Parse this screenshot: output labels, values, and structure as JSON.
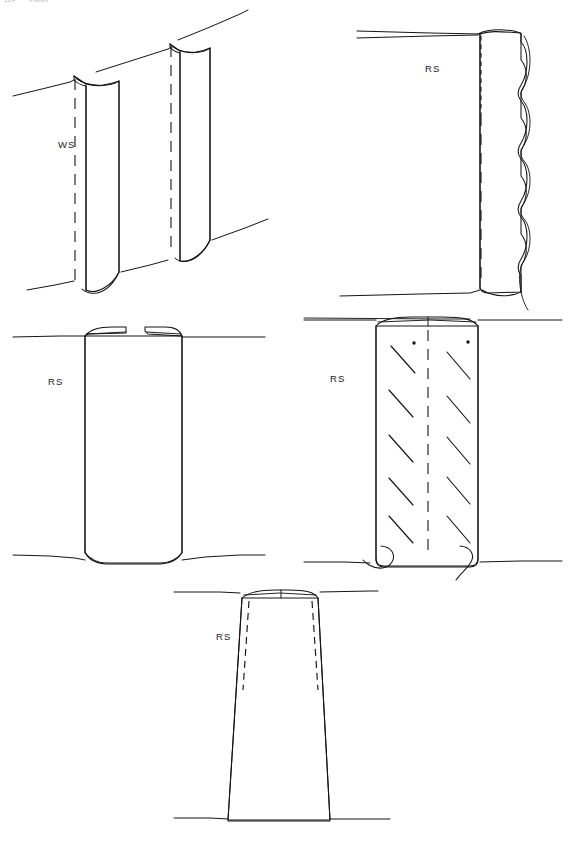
{
  "page": {
    "header_page_number": "124",
    "header_running_title": "Plates",
    "background_color": "#ffffff",
    "ink_color": "#141414",
    "width": 575,
    "height": 850
  },
  "figure": {
    "type": "technical-line-drawing-plate",
    "panel_count": 5,
    "panels": [
      {
        "id": "panel-1",
        "position": "top-left",
        "label": "WS",
        "label_x": 58,
        "label_y": 148,
        "description": "two overlapping vertical sheath blades rising from an inclined ground line, each with a curled top lip and a dashed hidden centre line",
        "ground_line": "inclined",
        "hidden_centerlines": 2,
        "has_top_lip": true,
        "has_hatching": false,
        "has_scalloped_edge": false,
        "has_dots": false,
        "shape": "double-blade"
      },
      {
        "id": "panel-2",
        "position": "top-right",
        "label": "RS",
        "label_x": 425,
        "label_y": 72,
        "description": "flat vertical panel with a lobed scalloped right margin and a dashed hidden centre line",
        "ground_line": "horizontal",
        "hidden_centerlines": 1,
        "has_top_lip": true,
        "has_hatching": false,
        "has_scalloped_edge": true,
        "scallop_count": 5,
        "has_dots": false,
        "shape": "scalloped-panel"
      },
      {
        "id": "panel-3",
        "position": "middle-left",
        "label": "RS",
        "label_x": 48,
        "label_y": 385,
        "description": "plain rectangular panel with a split top lip formed of two separate flaps and a smooth unmarked face",
        "ground_line": "horizontal",
        "hidden_centerlines": 0,
        "has_top_lip": true,
        "top_lip_segments": 2,
        "has_hatching": false,
        "has_scalloped_edge": false,
        "has_dots": false,
        "shape": "plain-panel"
      },
      {
        "id": "panel-4",
        "position": "middle-right",
        "label": "RS",
        "label_x": 330,
        "label_y": 382,
        "description": "rectangular panel bearing oblique hatch strokes in two columns, two small punctate dots near the top and hooked basal appendages",
        "ground_line": "horizontal",
        "hidden_centerlines": 1,
        "has_top_lip": true,
        "has_hatching": true,
        "hatch_rows": 5,
        "hatch_columns": 2,
        "has_scalloped_edge": false,
        "has_dots": true,
        "dot_count": 2,
        "has_basal_hooks": true,
        "shape": "hatched-panel"
      },
      {
        "id": "panel-5",
        "position": "bottom-centre",
        "label": "RS",
        "label_x": 216,
        "label_y": 640,
        "description": "flared trapezoidal form widening towards the base, with short dashed hidden lines inside each upper margin",
        "ground_line": "horizontal",
        "hidden_centerlines": 0,
        "has_top_lip": true,
        "has_hatching": false,
        "has_scalloped_edge": false,
        "has_dots": false,
        "has_dashed_inner_edges": true,
        "shape": "flared-trapezoid"
      }
    ],
    "legend": {
      "ws": "WS",
      "rs": "RS"
    }
  }
}
